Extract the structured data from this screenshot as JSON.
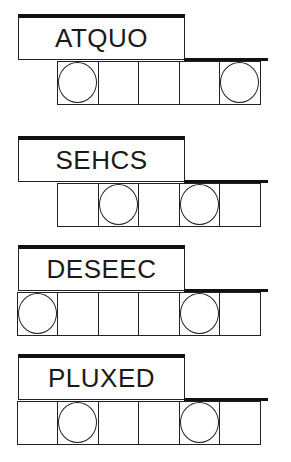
{
  "puzzles": [
    {
      "scrambled": "ATQUO",
      "cells": [
        {
          "present": false,
          "circled": false
        },
        {
          "present": true,
          "circled": true
        },
        {
          "present": true,
          "circled": false
        },
        {
          "present": true,
          "circled": false
        },
        {
          "present": true,
          "circled": false
        },
        {
          "present": true,
          "circled": true
        }
      ]
    },
    {
      "scrambled": "SEHCS",
      "cells": [
        {
          "present": false,
          "circled": false
        },
        {
          "present": true,
          "circled": false
        },
        {
          "present": true,
          "circled": true
        },
        {
          "present": true,
          "circled": false
        },
        {
          "present": true,
          "circled": true
        },
        {
          "present": true,
          "circled": false
        }
      ]
    },
    {
      "scrambled": "DESEEC",
      "cells": [
        {
          "present": true,
          "circled": true
        },
        {
          "present": true,
          "circled": false
        },
        {
          "present": true,
          "circled": false
        },
        {
          "present": true,
          "circled": false
        },
        {
          "present": true,
          "circled": true
        },
        {
          "present": true,
          "circled": false
        }
      ]
    },
    {
      "scrambled": "PLUXED",
      "cells": [
        {
          "present": true,
          "circled": false
        },
        {
          "present": true,
          "circled": true
        },
        {
          "present": true,
          "circled": false
        },
        {
          "present": true,
          "circled": false
        },
        {
          "present": true,
          "circled": true
        },
        {
          "present": true,
          "circled": false
        }
      ]
    }
  ]
}
